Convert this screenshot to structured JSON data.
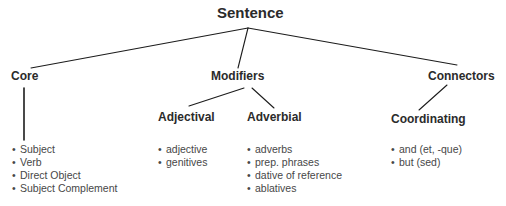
{
  "diagram": {
    "title": "Sentence",
    "background_color": "#ffffff",
    "line_color": "#1c1c1c",
    "header_color": "#2b2b2b",
    "text_color": "#474747",
    "bullet_glyph": "•",
    "root": {
      "label": "Sentence"
    },
    "branches": [
      {
        "label": "Core",
        "children": [],
        "items": [
          "Subject",
          "Verb",
          "Direct Object",
          "Subject Complement"
        ]
      },
      {
        "label": "Modifiers",
        "children": [
          {
            "label": "Adjectival",
            "items": [
              "adjective",
              "genitives"
            ]
          },
          {
            "label": "Adverbial",
            "items": [
              "adverbs",
              "prep. phrases",
              "dative of reference",
              "ablatives"
            ]
          }
        ],
        "items": []
      },
      {
        "label": "Connectors",
        "children": [
          {
            "label": "Coordinating",
            "items": [
              "and (et, -que)",
              "but (sed)"
            ]
          }
        ],
        "items": []
      }
    ]
  }
}
